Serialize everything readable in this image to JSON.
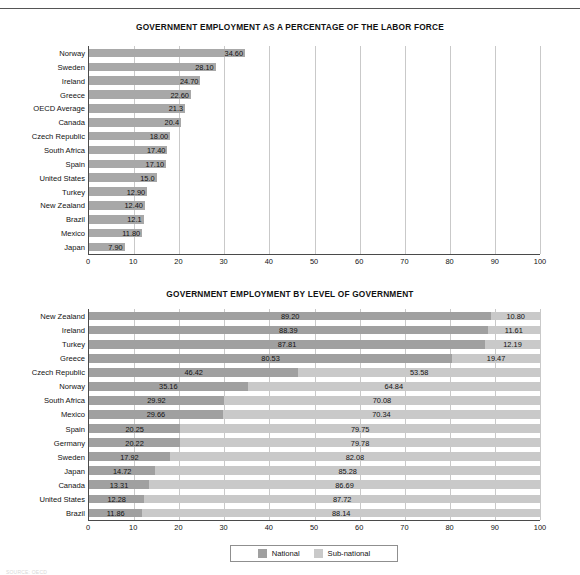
{
  "document": {
    "footnote": "SOURCE: OECD"
  },
  "chart_data": [
    {
      "type": "bar",
      "id": "labor-force-share",
      "title": "GOVERNMENT EMPLOYMENT AS A PERCENTAGE OF THE LABOR FORCE",
      "orientation": "horizontal",
      "xlabel": "",
      "ylabel": "",
      "xlim": [
        0,
        100
      ],
      "xticks": [
        0,
        10,
        20,
        30,
        40,
        50,
        60,
        70,
        80,
        90,
        100
      ],
      "grid": true,
      "legend": null,
      "categories": [
        "Norway",
        "Sweden",
        "Ireland",
        "Greece",
        "OECD Average",
        "Canada",
        "Czech Republic",
        "South Africa",
        "Spain",
        "United States",
        "Turkey",
        "New Zealand",
        "Brazil",
        "Mexico",
        "Japan"
      ],
      "values": [
        34.6,
        28.1,
        24.7,
        22.6,
        21.3,
        20.4,
        18.0,
        17.4,
        17.1,
        15.0,
        12.9,
        12.4,
        12.1,
        11.8,
        7.9
      ],
      "labels": [
        "34.60",
        "28.10",
        "24.70",
        "22.60",
        "21.3",
        "20.4",
        "18.00",
        "17.40",
        "17.10",
        "15.0",
        "12.90",
        "12.40",
        "12.1",
        "11.80",
        "7.90"
      ],
      "colors": {
        "bar": "#a8a8a8"
      }
    },
    {
      "type": "bar",
      "id": "level-of-government",
      "title": "GOVERNMENT EMPLOYMENT BY LEVEL OF GOVERNMENT",
      "orientation": "horizontal",
      "stacked": true,
      "xlabel": "",
      "ylabel": "",
      "xlim": [
        0,
        100
      ],
      "xticks": [
        0,
        10,
        20,
        30,
        40,
        50,
        60,
        70,
        80,
        90,
        100
      ],
      "grid": true,
      "legend_position": "bottom",
      "categories": [
        "New Zealand",
        "Ireland",
        "Turkey",
        "Greece",
        "Czech Republic",
        "Norway",
        "South Africa",
        "Mexico",
        "Spain",
        "Germany",
        "Sweden",
        "Japan",
        "Canada",
        "United States",
        "Brazil"
      ],
      "series": [
        {
          "name": "National",
          "color": "#a0a0a0",
          "values": [
            89.2,
            88.39,
            87.81,
            80.53,
            46.42,
            35.16,
            29.92,
            29.66,
            20.25,
            20.22,
            17.92,
            14.72,
            13.31,
            12.28,
            11.86
          ],
          "labels": [
            "89.20",
            "88.39",
            "87.81",
            "80.53",
            "46.42",
            "35.16",
            "29.92",
            "29.66",
            "20.25",
            "20.22",
            "17.92",
            "14.72",
            "13.31",
            "12.28",
            "11.86"
          ]
        },
        {
          "name": "Sub-national",
          "color": "#c9c9c9",
          "values": [
            10.8,
            11.61,
            12.19,
            19.47,
            53.58,
            64.84,
            70.08,
            70.34,
            79.75,
            79.78,
            82.08,
            85.28,
            86.69,
            87.72,
            88.14
          ],
          "labels": [
            "10.80",
            "11.61",
            "12.19",
            "19.47",
            "53.58",
            "64.84",
            "70.08",
            "70.34",
            "79.75",
            "79.78",
            "82.08",
            "85.28",
            "86.69",
            "87.72",
            "88.14"
          ]
        }
      ]
    }
  ]
}
